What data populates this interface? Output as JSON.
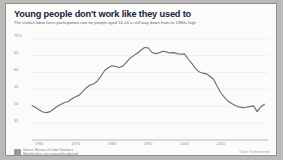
{
  "card": {
    "title": "Young people don't work like they used to",
    "subtitle": "The civilian labor force participation rate for people aged 16-24 is still way down from its 1980s high"
  },
  "footer": {
    "logo_icon": "publisher-logo-icon",
    "source_line_1": "Source: Bureau of Labor Statistics",
    "source_line_2": "Monthly data, not seasonally adjusted",
    "credit": "Chart: The Economist"
  },
  "colors": {
    "card_background": "#fbfbfa",
    "page_background": "#b9b9b7",
    "title": "#16243a",
    "subtitle": "#5d6470",
    "line": "#6a7078",
    "gridline": "#e7e7e4",
    "axis": "#a8a8a4",
    "tick_label": "#8a8f98"
  },
  "chart_data": {
    "type": "line",
    "title": "Young people don't work like they used to",
    "subtitle": "The civilian labor force participation rate for people aged 16-24 is still way down from its 1980s high",
    "xlabel": "",
    "ylabel": "",
    "ylim": [
      40,
      72
    ],
    "xlim": [
      1958,
      2023
    ],
    "grid": true,
    "legend": false,
    "ytick_labels": [
      "70%",
      "65",
      "60",
      "55",
      "50",
      "45"
    ],
    "ytick_values": [
      70,
      65,
      60,
      55,
      50,
      45
    ],
    "xtick_labels": [
      "1960",
      "1970",
      "1980",
      "1990",
      "2000",
      "2010"
    ],
    "xtick_values": [
      1960,
      1970,
      1980,
      1990,
      2000,
      2010
    ],
    "series": [
      {
        "name": "Labor force participation rate, ages 16-24",
        "x": [
          1958,
          1959,
          1960,
          1961,
          1962,
          1963,
          1964,
          1965,
          1966,
          1967,
          1968,
          1969,
          1970,
          1971,
          1972,
          1973,
          1974,
          1975,
          1976,
          1977,
          1978,
          1979,
          1980,
          1981,
          1982,
          1983,
          1984,
          1985,
          1986,
          1987,
          1988,
          1989,
          1990,
          1991,
          1992,
          1993,
          1994,
          1995,
          1996,
          1997,
          1998,
          1999,
          2000,
          2001,
          2002,
          2003,
          2004,
          2005,
          2006,
          2007,
          2008,
          2009,
          2010,
          2011,
          2012,
          2013,
          2014,
          2015,
          2016,
          2017,
          2018,
          2019,
          2020,
          2021,
          2022
        ],
        "values": [
          50.2,
          49.6,
          48.9,
          48.3,
          48.1,
          48.4,
          49.2,
          50.0,
          50.6,
          51.1,
          51.4,
          52.2,
          52.8,
          53.3,
          54.4,
          55.5,
          56.3,
          56.6,
          57.5,
          58.9,
          60.6,
          61.4,
          62.0,
          61.8,
          61.5,
          61.9,
          63.1,
          64.2,
          65.0,
          65.7,
          66.6,
          67.4,
          67.3,
          66.0,
          65.6,
          65.8,
          66.3,
          66.1,
          65.8,
          65.9,
          65.6,
          65.4,
          65.5,
          64.0,
          62.7,
          61.2,
          60.2,
          59.8,
          59.6,
          58.9,
          58.0,
          55.9,
          54.0,
          52.6,
          51.5,
          50.8,
          50.2,
          49.8,
          49.6,
          49.7,
          49.9,
          50.1,
          48.4,
          49.8,
          50.6
        ]
      }
    ]
  }
}
